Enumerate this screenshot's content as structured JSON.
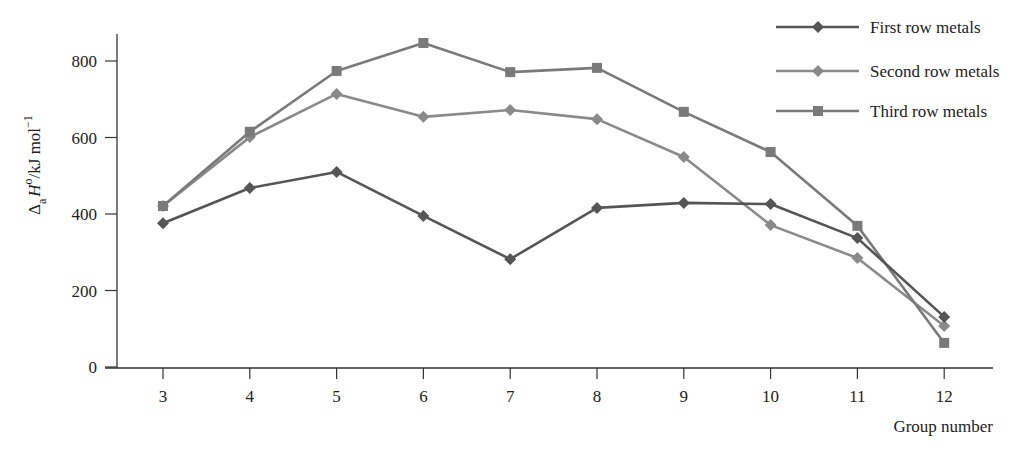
{
  "chart_data": {
    "type": "line",
    "title": "",
    "xlabel": "Group number",
    "ylabel": "ΔaH°/kJ mol⁻¹",
    "ylabel_parts": {
      "delta": "Δ",
      "sub": "a",
      "H": "H",
      "sup": "o",
      "unit": "/kJ mol",
      "unit_sup": "−1"
    },
    "x": [
      3,
      4,
      5,
      6,
      7,
      8,
      9,
      10,
      11,
      12
    ],
    "yticks": [
      0,
      200,
      400,
      600,
      800
    ],
    "xlim": [
      2.5,
      12.55
    ],
    "ylim": [
      0,
      880
    ],
    "grid": false,
    "legend_position": "top-right",
    "series": [
      {
        "name": "First row metals",
        "marker": "diamond",
        "color": "#555555",
        "values": [
          376,
          468,
          510,
          395,
          282,
          416,
          429,
          426,
          337,
          131
        ]
      },
      {
        "name": "Second row metals",
        "marker": "diamond",
        "color": "#8a8a8a",
        "values": [
          421,
          601,
          714,
          654,
          672,
          648,
          549,
          371,
          285,
          107
        ]
      },
      {
        "name": "Third row metals",
        "marker": "square",
        "color": "#7a7a7a",
        "values": [
          421,
          615,
          774,
          847,
          771,
          782,
          667,
          562,
          369,
          63
        ]
      }
    ]
  }
}
